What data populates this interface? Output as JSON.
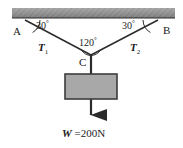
{
  "diagram": {
    "type": "free-body-force-diagram",
    "ceiling": {
      "name": "ceiling-support",
      "hatched": true,
      "color": "#8c8c8c"
    },
    "points": {
      "A": {
        "label": "A",
        "x": 25,
        "y": 22
      },
      "B": {
        "label": "B",
        "x": 158,
        "y": 22
      },
      "C": {
        "label": "C",
        "x": 91,
        "y": 55
      }
    },
    "angles": [
      {
        "name": "angle-at-A",
        "label": "30",
        "degree_symbol": "°"
      },
      {
        "name": "angle-at-B",
        "label": "30",
        "degree_symbol": "°"
      },
      {
        "name": "angle-at-C",
        "label": "120",
        "degree_symbol": "°"
      }
    ],
    "tensions": [
      {
        "name": "tension-T1",
        "symbol": "T",
        "subscript": "1"
      },
      {
        "name": "tension-T2",
        "symbol": "T",
        "subscript": "2"
      }
    ],
    "block": {
      "name": "hanging-block",
      "fill": "#a8a8a8",
      "stroke": "#3c3c3c"
    },
    "weight": {
      "symbol": "W",
      "equals": "=",
      "value": "200",
      "unit": "N",
      "text": "W =200N"
    },
    "colors": {
      "line": "#2b2b2b",
      "ceiling": "#8c8c8c",
      "block_fill": "#a8a8a8",
      "background": "#ffffff"
    }
  }
}
